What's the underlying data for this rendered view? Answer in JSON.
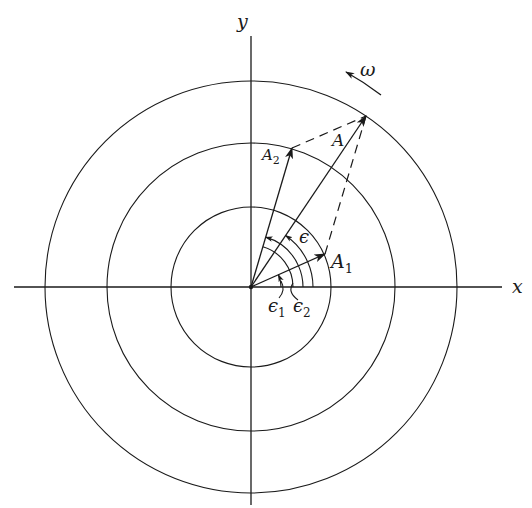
{
  "figure": {
    "type": "phasor-diagram",
    "axes": {
      "x_label": "x",
      "y_label": "y",
      "origin": [
        251,
        287
      ]
    },
    "circles": [
      {
        "name": "inner",
        "radius": 80
      },
      {
        "name": "middle",
        "radius": 144
      },
      {
        "name": "outer",
        "radius": 206
      }
    ],
    "vectors": [
      {
        "name": "A1",
        "label": "A",
        "subscript": "1",
        "tip": [
          325,
          254
        ]
      },
      {
        "name": "A2",
        "label": "A",
        "subscript": "2",
        "tip": [
          292,
          148
        ]
      },
      {
        "name": "A",
        "label": "A",
        "subscript": "",
        "tip": [
          366,
          116
        ]
      }
    ],
    "angles": [
      {
        "name": "epsilon1",
        "label": "ϵ",
        "subscript": "1"
      },
      {
        "name": "epsilon2",
        "label": "ϵ",
        "subscript": "2"
      },
      {
        "name": "epsilon",
        "label": "ϵ",
        "subscript": ""
      }
    ],
    "rotation": {
      "label": "ω",
      "direction": "counterclockwise"
    }
  }
}
